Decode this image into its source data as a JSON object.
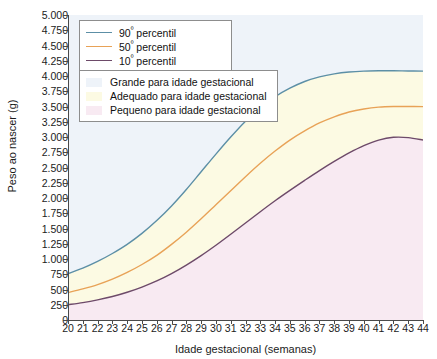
{
  "chart_data": {
    "type": "line",
    "title": "",
    "xlabel": "Idade gestacional (semanas)",
    "ylabel": "Peso ao nascer (g)",
    "xlim": [
      20,
      44
    ],
    "ylim": [
      0,
      5000
    ],
    "grid": false,
    "legend_position": "top-left",
    "x": [
      20,
      21,
      22,
      23,
      24,
      25,
      26,
      27,
      28,
      29,
      30,
      31,
      32,
      33,
      34,
      35,
      36,
      37,
      38,
      39,
      40,
      41,
      42,
      43,
      44
    ],
    "xticklabels": [
      "20",
      "21",
      "22",
      "23",
      "24",
      "25",
      "26",
      "27",
      "28",
      "29",
      "30",
      "31",
      "32",
      "33",
      "34",
      "35",
      "36",
      "37",
      "38",
      "39",
      "40",
      "41",
      "42",
      "43",
      "44"
    ],
    "yticks": [
      0,
      250,
      500,
      750,
      1000,
      1250,
      1500,
      1750,
      2000,
      2250,
      2500,
      2750,
      3000,
      3250,
      3500,
      3750,
      4000,
      4250,
      4500,
      4750,
      5000
    ],
    "yticklabels": [
      "0",
      "250",
      "500",
      "750",
      "1.000",
      "1.250",
      "1.500",
      "1.750",
      "2.000",
      "2.250",
      "2.500",
      "2.750",
      "3.000",
      "3.250",
      "3.500",
      "3.750",
      "4.000",
      "4.250",
      "4.500",
      "4.750",
      "5.000"
    ],
    "series": [
      {
        "name": "90º percentil",
        "color": "#5c8fa6",
        "values": [
          760,
          850,
          960,
          1090,
          1240,
          1420,
          1630,
          1870,
          2140,
          2430,
          2720,
          3000,
          3260,
          3480,
          3660,
          3800,
          3910,
          3985,
          4035,
          4065,
          4080,
          4085,
          4085,
          4082,
          4080
        ]
      },
      {
        "name": "50º percentil",
        "color": "#e8a257",
        "values": [
          450,
          510,
          580,
          670,
          780,
          910,
          1060,
          1240,
          1440,
          1660,
          1890,
          2120,
          2350,
          2570,
          2770,
          2950,
          3100,
          3230,
          3330,
          3410,
          3460,
          3490,
          3500,
          3500,
          3498
        ]
      },
      {
        "name": "10º percentil",
        "color": "#6d4a69",
        "values": [
          250,
          285,
          330,
          385,
          455,
          540,
          640,
          760,
          900,
          1055,
          1225,
          1405,
          1590,
          1775,
          1955,
          2125,
          2290,
          2450,
          2600,
          2740,
          2860,
          2950,
          2995,
          2990,
          2950
        ]
      }
    ],
    "bands": [
      {
        "name": "Grande para idade gestacional",
        "color": "#eef3f9"
      },
      {
        "name": "Adequado para idade gestacional",
        "color": "#fcfae3"
      },
      {
        "name": "Pequeno para idade gestacional",
        "color": "#f8eaf2"
      }
    ]
  },
  "legend_lines": {
    "items": [
      {
        "prefix": "90",
        "ord": "º",
        "suffix": " percentil"
      },
      {
        "prefix": "50",
        "ord": "º",
        "suffix": " percentil"
      },
      {
        "prefix": "10",
        "ord": "º",
        "suffix": " percentil"
      }
    ]
  }
}
